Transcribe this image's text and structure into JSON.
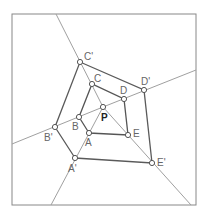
{
  "diagram": {
    "frame": {
      "x": 12,
      "y": 14,
      "w": 184,
      "h": 191,
      "stroke": "#888888"
    },
    "colors": {
      "ray": "#a0a0a0",
      "inner_pentagon": "#555555",
      "outer_pentagon": "#5a5a5a",
      "spoke": "#999999",
      "point_fill": "#ffffff",
      "point_stroke": "#555555"
    },
    "center": {
      "name": "P",
      "x": 103,
      "y": 107,
      "label": "P",
      "label_x": 101,
      "label_y": 121
    },
    "inner_points": [
      {
        "name": "A",
        "x": 89,
        "y": 133,
        "label": "A",
        "label_x": 85,
        "label_y": 146
      },
      {
        "name": "B",
        "x": 79,
        "y": 117,
        "label": "B",
        "label_x": 72,
        "label_y": 130
      },
      {
        "name": "C",
        "x": 92,
        "y": 84,
        "label": "C",
        "label_x": 94,
        "label_y": 82
      },
      {
        "name": "D",
        "x": 124,
        "y": 99,
        "label": "D",
        "label_x": 120,
        "label_y": 94
      },
      {
        "name": "E",
        "x": 128,
        "y": 135,
        "label": "E",
        "label_x": 133,
        "label_y": 137
      }
    ],
    "outer_points": [
      {
        "name": "A'",
        "x": 75,
        "y": 158,
        "label": "A'",
        "label_x": 68,
        "label_y": 172
      },
      {
        "name": "B'",
        "x": 55,
        "y": 127,
        "label": "B'",
        "label_x": 44,
        "label_y": 141
      },
      {
        "name": "C'",
        "x": 80,
        "y": 62,
        "label": "C'",
        "label_x": 84,
        "label_y": 60
      },
      {
        "name": "D'",
        "x": 144,
        "y": 90,
        "label": "D'",
        "label_x": 141,
        "label_y": 85
      },
      {
        "name": "E'",
        "x": 152,
        "y": 163,
        "label": "E'",
        "label_x": 157,
        "label_y": 166
      }
    ],
    "rays": [
      {
        "name": "ray-a",
        "x1": 103,
        "y1": 107,
        "x2": 51,
        "y2": 205
      },
      {
        "name": "ray-b",
        "x1": 103,
        "y1": 107,
        "x2": 12,
        "y2": 144
      },
      {
        "name": "ray-c",
        "x1": 103,
        "y1": 107,
        "x2": 56,
        "y2": 14
      },
      {
        "name": "ray-d",
        "x1": 103,
        "y1": 107,
        "x2": 196,
        "y2": 70
      },
      {
        "name": "ray-e",
        "x1": 103,
        "y1": 107,
        "x2": 191,
        "y2": 205
      }
    ]
  }
}
